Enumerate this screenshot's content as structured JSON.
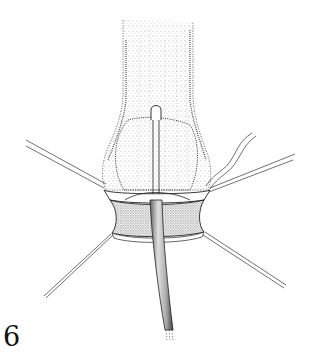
{
  "figure": {
    "label": "6",
    "type": "surgical line illustration",
    "colors": {
      "ink": "#1a1a1a",
      "stipple": "#555555",
      "background": "#ffffff",
      "tube_fill": "#bdbdbd"
    }
  }
}
